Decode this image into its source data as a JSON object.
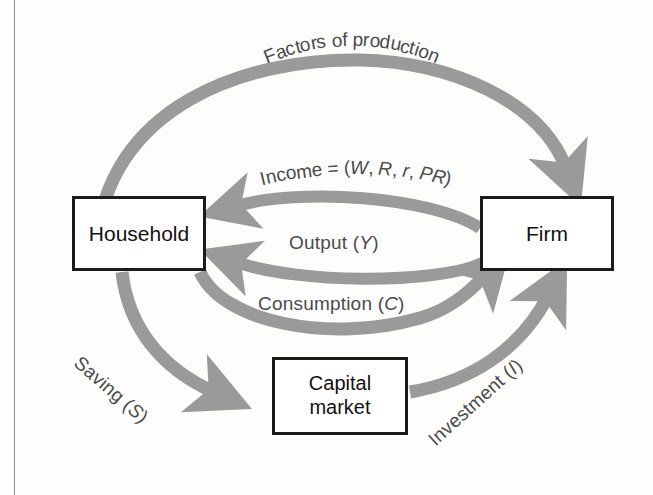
{
  "diagram": {
    "colors": {
      "arrow_gray": "#9a9a9a",
      "box_border": "#1b1b1b",
      "text": "#4b4b4b",
      "background": "#fdfdfc"
    },
    "nodes": [
      {
        "id": "household",
        "label": "Household",
        "label_lines": [
          "Household"
        ]
      },
      {
        "id": "firm",
        "label": "Firm",
        "label_lines": [
          "Firm"
        ]
      },
      {
        "id": "capital-market",
        "label": "Capital market",
        "label_lines": [
          "Capital",
          "market"
        ]
      }
    ],
    "flows": [
      {
        "id": "factors-of-production",
        "label": "Factors of production",
        "from": "household",
        "to": "firm",
        "shape": "outer-top-arc"
      },
      {
        "id": "income",
        "label": "Income = (W, R, r, PR)",
        "from": "firm",
        "to": "household",
        "shape": "inner-arc"
      },
      {
        "id": "output",
        "label": "Output (Y)",
        "from": "firm",
        "to": "household",
        "shape": "inner-arc"
      },
      {
        "id": "consumption",
        "label": "Consumption (C)",
        "from": "household",
        "to": "firm",
        "shape": "lower-inner-arc"
      },
      {
        "id": "saving",
        "label": "Saving (S)",
        "from": "household",
        "to": "capital-market",
        "shape": "lower-left-arc"
      },
      {
        "id": "investment",
        "label": "Investment (I)",
        "from": "capital-market",
        "to": "firm",
        "shape": "lower-right-arc"
      }
    ],
    "label_parts": {
      "income_prefix": "Income = (",
      "income_w": "W",
      "income_sep1": ", ",
      "income_r_cap": "R",
      "income_sep2": ", ",
      "income_r_low": "r",
      "income_sep3": ", ",
      "income_pr": "PR",
      "income_suffix": ")",
      "output_prefix": "Output (",
      "output_var": "Y",
      "output_suffix": ")",
      "consumption_prefix": "Consumption (",
      "consumption_var": "C",
      "consumption_suffix": ")",
      "saving_prefix": "Saving (",
      "saving_var": "S",
      "saving_suffix": ")",
      "investment_prefix": "Investment (",
      "investment_var": "I",
      "investment_suffix": ")",
      "factors_text": "Factors of production"
    }
  }
}
